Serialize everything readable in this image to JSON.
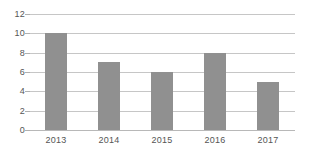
{
  "chart_data": {
    "type": "bar",
    "title": "",
    "subtitle": "",
    "xlabel": "",
    "ylabel": "",
    "categories": [
      "2013",
      "2014",
      "2015",
      "2016",
      "2017"
    ],
    "values": [
      10,
      7,
      6,
      8,
      5
    ],
    "series": [
      {
        "name": "",
        "values": [
          10,
          7,
          6,
          8,
          5
        ]
      }
    ],
    "ylim": [
      0,
      12
    ],
    "y_ticks": [
      0,
      2,
      4,
      6,
      8,
      10,
      12
    ],
    "y_tick_labels": [
      "0",
      "2",
      "4",
      "6",
      "8",
      "10",
      "12"
    ],
    "x_tick_labels": [
      "2013",
      "2014",
      "2015",
      "2016",
      "2017"
    ],
    "grid": true,
    "grid_axis": "y",
    "legend": false,
    "legend_position": "none",
    "annotations": [],
    "colors": {
      "bar": "#909090",
      "gridline": "#c6c6c6",
      "tick": "#b0b0b0",
      "text": "#555555",
      "background": "#ffffff",
      "baseline": "#b8b8b8"
    }
  }
}
